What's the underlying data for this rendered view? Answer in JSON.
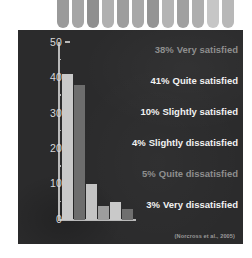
{
  "decoration": {
    "name": "top-bar-strip",
    "bar_colors": [
      "#9a9a9a",
      "#a5a5a5",
      "#8f8f8f",
      "#b0b0b0",
      "#9d9d9d",
      "#a8a8a8",
      "#949494",
      "#b4b4b4",
      "#a0a0a0",
      "#aeaeae",
      "#c6c6c6",
      "#b8b8b8"
    ]
  },
  "panel": {
    "background_color": "#2b2b2c"
  },
  "chart_data": {
    "type": "bar",
    "title": "",
    "subtitle": "",
    "xlabel": "",
    "ylabel": "",
    "ylim": [
      0,
      50
    ],
    "grid": false,
    "legend_position": "right",
    "categories": [
      "Very satisfied",
      "Quite satisfied",
      "Slightly satisfied",
      "Slightly dissatisfied",
      "Quite dissatisfied",
      "Very dissatisfied"
    ],
    "values": [
      41,
      38,
      10,
      4,
      5,
      3
    ],
    "bar_colors": [
      "#c9c9c9",
      "#6d6d6d",
      "#c4c4c4",
      "#9d9d9d",
      "#c9c9c9",
      "#6f6f6f"
    ],
    "y_ticks": [
      50,
      40,
      30,
      20,
      10,
      0
    ],
    "y_tick_labels": [
      "50",
      "40",
      "30",
      "20",
      "10",
      "0"
    ],
    "axis_color": "#b9b9b9",
    "annotation": "(Norcross et al., 2005)"
  },
  "legend": {
    "entries": [
      {
        "pct": "38%",
        "label": "Very satisfied",
        "style": "dim"
      },
      {
        "pct": "41%",
        "label": "Quite satisfied",
        "style": "bright"
      },
      {
        "pct": "10%",
        "label": "Slightly satisfied",
        "style": "bright"
      },
      {
        "pct": "4%",
        "label": "Slightly dissatisfied",
        "style": "bright"
      },
      {
        "pct": "5%",
        "label": "Quite dissatisfied",
        "style": "dim"
      },
      {
        "pct": "3%",
        "label": "Very dissatisfied",
        "style": "bright"
      }
    ],
    "bright_color": "#f2f2f2",
    "dim_color": "#8e8e8e"
  },
  "citation": {
    "text": "(Norcross et al., 2005)"
  }
}
